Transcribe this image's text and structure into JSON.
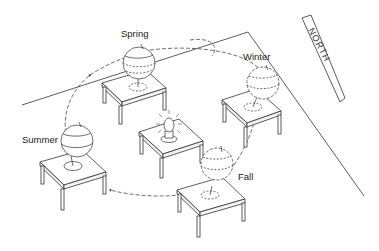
{
  "diagram": {
    "labels": {
      "spring": "Spring",
      "winter": "Winter",
      "summer": "Summer",
      "fall": "Fall",
      "north_sign": "NORTH"
    },
    "elements": [
      {
        "name": "central-lamp",
        "label": ""
      },
      {
        "name": "globe-spring",
        "label": "Spring"
      },
      {
        "name": "globe-winter",
        "label": "Winter"
      },
      {
        "name": "globe-summer",
        "label": "Summer"
      },
      {
        "name": "globe-fall",
        "label": "Fall"
      },
      {
        "name": "north-sign",
        "label": "NORTH"
      }
    ],
    "colors": {
      "line": "#333333",
      "background": "#ffffff"
    }
  }
}
